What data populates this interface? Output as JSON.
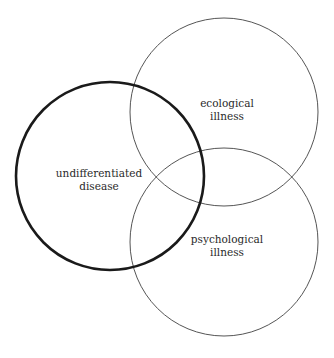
{
  "diagram": {
    "type": "venn",
    "circles": [
      {
        "id": "undifferentiated-disease",
        "lines": [
          "undifferentiated",
          "disease"
        ],
        "emphasis": "bold",
        "stroke": "#1a1a1a"
      },
      {
        "id": "ecological-illness",
        "lines": [
          "ecological",
          "illness"
        ],
        "emphasis": "normal",
        "stroke": "#555555"
      },
      {
        "id": "psychological-illness",
        "lines": [
          "psychological",
          "illness"
        ],
        "emphasis": "normal",
        "stroke": "#555555"
      }
    ]
  }
}
